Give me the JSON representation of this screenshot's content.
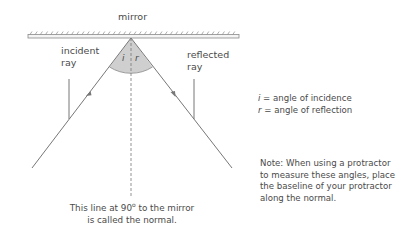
{
  "diagram": {
    "title_label": "mirror",
    "incident_label_line1": "incident",
    "incident_label_line2": "ray",
    "reflected_label_line1": "reflected",
    "reflected_label_line2": "ray",
    "angle_i_symbol": "i",
    "angle_r_symbol": "r",
    "normal_caption_line1_pre": "This line at 90",
    "normal_caption_degree": "o",
    "normal_caption_line1_post": " to the mirror",
    "normal_caption_line2": "is called the normal."
  },
  "key": {
    "i_symbol": "i",
    "i_text": " = angle of incidence",
    "r_symbol": "r",
    "r_text": " = angle of reflection"
  },
  "note": {
    "text": "Note: When using a protractor to measure these angles, place the baseline of your protractor along the normal."
  },
  "colors": {
    "line": "#777777",
    "wedge_fill": "#c8c8c8",
    "text": "#4a4a4a"
  }
}
